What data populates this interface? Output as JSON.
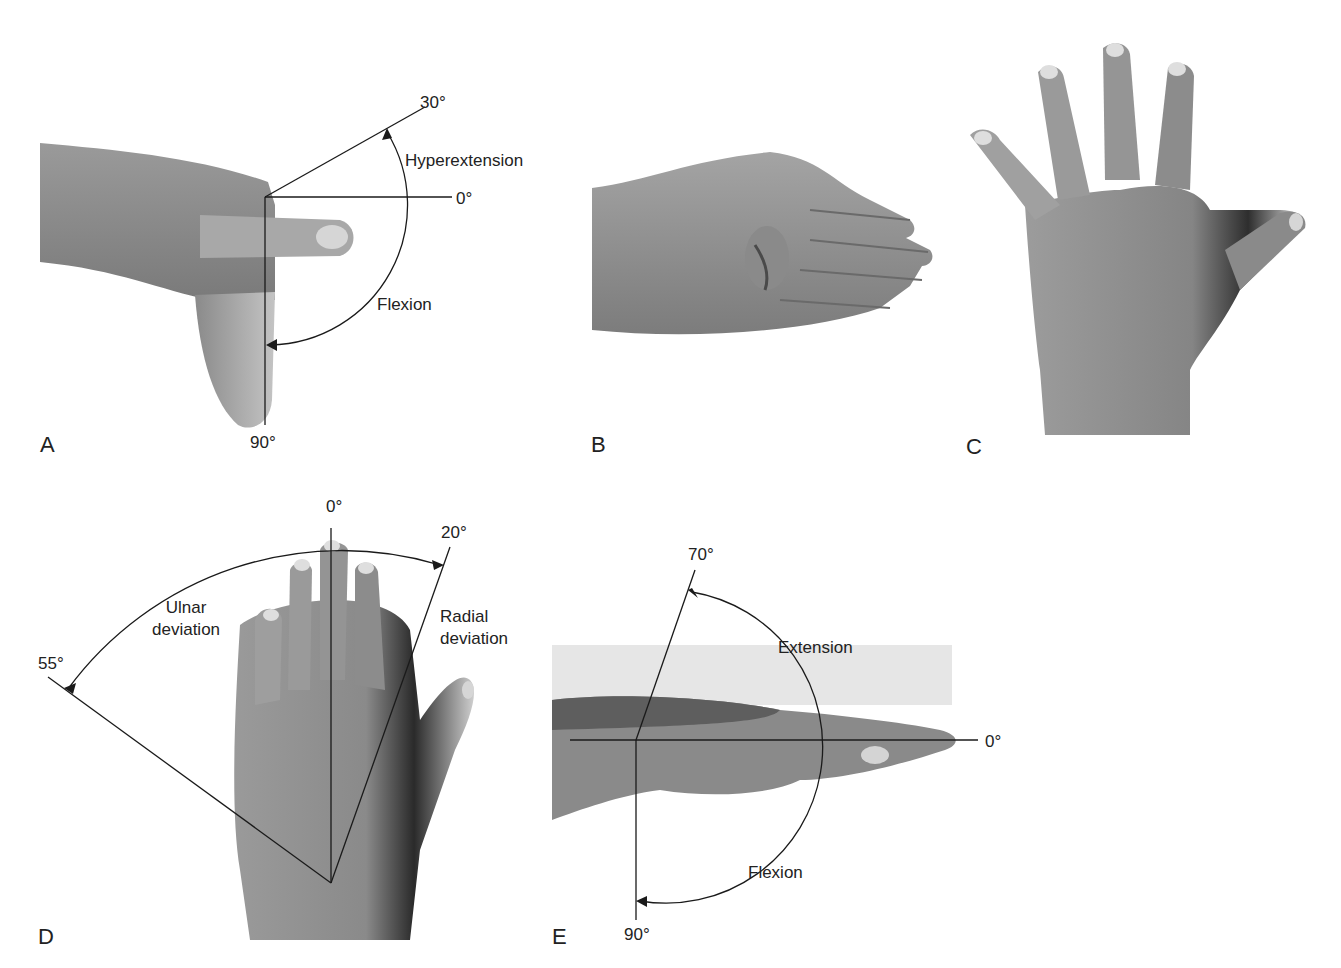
{
  "figure": {
    "panels": [
      {
        "id": "A",
        "label": "A",
        "view": "lateral view of hand, finger flexion/hyperextension at MCP joint",
        "angles": {
          "top": "30°",
          "middle": "0°",
          "bottom": "90°"
        },
        "motions": {
          "upper": "Hyperextension",
          "lower": "Flexion"
        }
      },
      {
        "id": "B",
        "label": "B",
        "view": "lateral view of hand with thumb flexed across palm"
      },
      {
        "id": "C",
        "label": "C",
        "view": "dorsal view of hand with fingers spread (abduction)"
      },
      {
        "id": "D",
        "label": "D",
        "view": "dorsal view of hand, wrist ulnar/radial deviation",
        "angles": {
          "left": "55°",
          "center": "0°",
          "right": "20°"
        },
        "motions": {
          "left_line1": "Ulnar",
          "left_line2": "deviation",
          "right_line1": "Radial",
          "right_line2": "deviation"
        }
      },
      {
        "id": "E",
        "label": "E",
        "view": "lateral view of hand, wrist extension/flexion",
        "angles": {
          "top": "70°",
          "right": "0°",
          "bottom": "90°"
        },
        "motions": {
          "upper": "Extension",
          "lower": "Flexion"
        }
      }
    ]
  },
  "colors": {
    "background": "#ffffff",
    "line": "#1a1a1a",
    "skin_light": "#b8b8b8",
    "skin_mid": "#8e8e8e",
    "skin_dark": "#5a5a5a"
  }
}
